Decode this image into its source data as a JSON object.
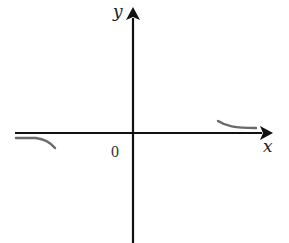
{
  "diagram": {
    "type": "coordinate-plane-sketch",
    "labels": {
      "x_axis": "x",
      "y_axis": "y",
      "origin": "0"
    },
    "colors": {
      "axis": "#111111",
      "curve": "#6a6a6a",
      "text": "#222222",
      "background": "#ffffff"
    },
    "geometry": {
      "origin": [
        133,
        133
      ],
      "x_axis": {
        "from": [
          15,
          133
        ],
        "to": [
          272,
          133
        ]
      },
      "y_axis": {
        "from": [
          133,
          243
        ],
        "to": [
          133,
          7
        ]
      },
      "curves": [
        {
          "name": "right-branch",
          "description": "approaches x-axis from above as x increases",
          "path": "M 218 121 C 226 126, 234 128, 256 128"
        },
        {
          "name": "left-branch",
          "description": "approaches x-axis from below as x decreases",
          "path": "M 16 138 L 36 138 C 44 139, 50 142, 55 148"
        }
      ]
    }
  }
}
